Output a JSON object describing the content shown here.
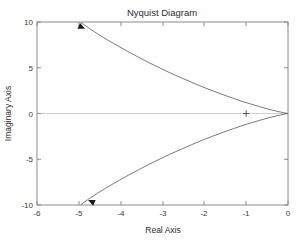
{
  "chart_data": {
    "type": "line",
    "title": "Nyquist Diagram",
    "xlabel": "Real Axis",
    "ylabel": "Imaginary Axis",
    "xlim": [
      -6,
      0
    ],
    "ylim": [
      -10,
      10
    ],
    "xticks": [
      -6,
      -5,
      -4,
      -3,
      -2,
      -1,
      0
    ],
    "xtick_labels": [
      "-6",
      "-5",
      "-4",
      "-3",
      "-2",
      "-1",
      "0"
    ],
    "yticks": [
      10,
      5,
      0,
      -5,
      -10
    ],
    "ytick_labels": [
      "10",
      "5",
      "0",
      "-5",
      "-10"
    ],
    "grid": false,
    "legend": null,
    "zero_line": true,
    "series": [
      {
        "name": "Nyquist response (positive frequencies)",
        "points": [
          [
            -4.95,
            9.95
          ],
          [
            -4.75,
            9.3
          ],
          [
            -4.55,
            8.7
          ],
          [
            -4.3,
            8.0
          ],
          [
            -4.05,
            7.35
          ],
          [
            -3.8,
            6.7
          ],
          [
            -3.55,
            6.1
          ],
          [
            -3.3,
            5.5
          ],
          [
            -3.05,
            4.95
          ],
          [
            -2.8,
            4.4
          ],
          [
            -2.55,
            3.9
          ],
          [
            -2.3,
            3.4
          ],
          [
            -2.05,
            2.92
          ],
          [
            -1.8,
            2.48
          ],
          [
            -1.55,
            2.05
          ],
          [
            -1.3,
            1.65
          ],
          [
            -1.1,
            1.33
          ],
          [
            -0.9,
            1.05
          ],
          [
            -0.7,
            0.78
          ],
          [
            -0.55,
            0.58
          ],
          [
            -0.4,
            0.4
          ],
          [
            -0.28,
            0.26
          ],
          [
            -0.18,
            0.16
          ],
          [
            -0.1,
            0.08
          ],
          [
            -0.04,
            0.03
          ],
          [
            0.0,
            0.0
          ]
        ]
      },
      {
        "name": "Nyquist response (negative frequencies)",
        "points": [
          [
            -4.95,
            -9.95
          ],
          [
            -4.75,
            -9.3
          ],
          [
            -4.55,
            -8.7
          ],
          [
            -4.3,
            -8.0
          ],
          [
            -4.05,
            -7.35
          ],
          [
            -3.8,
            -6.7
          ],
          [
            -3.55,
            -6.1
          ],
          [
            -3.3,
            -5.5
          ],
          [
            -3.05,
            -4.95
          ],
          [
            -2.8,
            -4.4
          ],
          [
            -2.55,
            -3.9
          ],
          [
            -2.3,
            -3.4
          ],
          [
            -2.05,
            -2.92
          ],
          [
            -1.8,
            -2.48
          ],
          [
            -1.55,
            -2.05
          ],
          [
            -1.3,
            -1.65
          ],
          [
            -1.1,
            -1.33
          ],
          [
            -0.9,
            -1.05
          ],
          [
            -0.7,
            -0.78
          ],
          [
            -0.55,
            -0.58
          ],
          [
            -0.4,
            -0.4
          ],
          [
            -0.28,
            -0.26
          ],
          [
            -0.18,
            -0.16
          ],
          [
            -0.1,
            -0.08
          ],
          [
            -0.04,
            -0.03
          ],
          [
            0.0,
            0.0
          ]
        ]
      }
    ],
    "markers": [
      {
        "name": "critical-point",
        "symbol": "+",
        "x": -1,
        "y": 0
      }
    ],
    "annotations": [
      {
        "name": "direction-arrow-upper",
        "x": -4.85,
        "y": 9.25,
        "angle_deg": 25
      },
      {
        "name": "direction-arrow-lower",
        "x": -4.78,
        "y": -9.45,
        "angle_deg": 205
      }
    ]
  }
}
